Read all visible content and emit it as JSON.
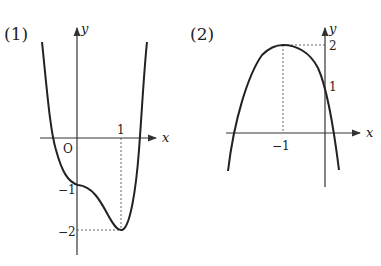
{
  "graph1": {
    "label": "(1)",
    "x_axis": "x",
    "y_axis": "y",
    "origin": "O",
    "tick_x": "1",
    "tick_y1": "−1",
    "tick_y2": "−2"
  },
  "graph2": {
    "label": "(2)",
    "x_axis": "x",
    "y_axis": "y",
    "tick_x": "−1",
    "tick_y1": "1",
    "tick_y2": "2"
  },
  "colors": {
    "curve": "#222222",
    "axis": "#333333"
  }
}
